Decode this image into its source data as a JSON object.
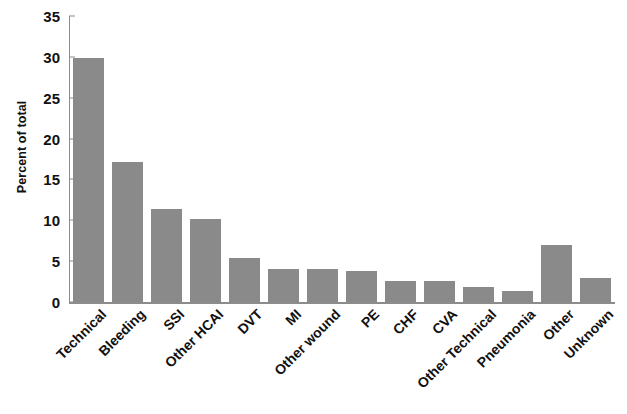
{
  "chart_data": {
    "type": "bar",
    "title": "",
    "subtitle": "",
    "xlabel": "",
    "ylabel": "Percent of total",
    "ylim": [
      0,
      35
    ],
    "ytick_interval": 5,
    "yticks": [
      0,
      5,
      10,
      15,
      20,
      25,
      30,
      35
    ],
    "ytick_labels": [
      "0",
      "5",
      "10",
      "15",
      "20",
      "25",
      "30",
      "35"
    ],
    "grid": false,
    "legend": null,
    "legend_position": "none",
    "bar_color": "#8a8a8a",
    "axis_color": "#8c8c8c",
    "text_color": "#111111",
    "categories": [
      "Technical",
      "Bleeding",
      "SSI",
      "Other HCAI",
      "DVT",
      "MI",
      "Other wound",
      "PE",
      "CHF",
      "CVA",
      "Other Technical",
      "Pneumonia",
      "Other",
      "Unknown"
    ],
    "values": [
      29.9,
      17.1,
      11.4,
      10.2,
      5.4,
      4.1,
      4.1,
      3.8,
      2.6,
      2.6,
      1.8,
      1.3,
      7.0,
      2.9
    ]
  }
}
